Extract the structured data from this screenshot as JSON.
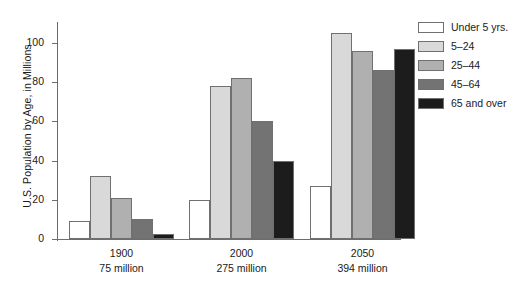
{
  "chart_data": {
    "type": "bar",
    "title": "",
    "xlabel": "",
    "ylabel": "U.S. Population by Age, in Millions",
    "ylim": [
      0,
      100
    ],
    "yticks": [
      0,
      20,
      40,
      60,
      80,
      100
    ],
    "grid": false,
    "legend_position": "right",
    "categories": [
      "1900",
      "2000",
      "2050"
    ],
    "category_sublabels": [
      "75 million",
      "275 million",
      "394 million"
    ],
    "series": [
      {
        "name": "Under 5 yrs.",
        "color": "#ffffff",
        "values": [
          9,
          20,
          27
        ]
      },
      {
        "name": "5–24",
        "color": "#d9d9d9",
        "values": [
          32,
          78,
          105
        ]
      },
      {
        "name": "25–44",
        "color": "#b0b0b0",
        "values": [
          21,
          82,
          96
        ]
      },
      {
        "name": "45–64",
        "color": "#737373",
        "values": [
          10,
          60,
          86
        ]
      },
      {
        "name": "65 and over",
        "color": "#1c1c1c",
        "values": [
          2.5,
          40,
          97
        ]
      }
    ]
  },
  "axis": {
    "tick_labels": [
      "100",
      "80",
      "60",
      "40",
      "20",
      "0"
    ]
  },
  "groups": [
    {
      "year": "1900",
      "population": "75 million"
    },
    {
      "year": "2000",
      "population": "275 million"
    },
    {
      "year": "2050",
      "population": "394 million"
    }
  ],
  "legend": {
    "items": [
      {
        "label": "Under 5 yrs."
      },
      {
        "label": "5–24"
      },
      {
        "label": "25–44"
      },
      {
        "label": "45–64"
      },
      {
        "label": "65 and over"
      }
    ]
  }
}
